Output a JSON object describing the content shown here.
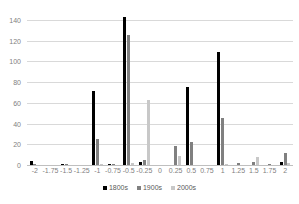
{
  "chart_data": {
    "type": "bar",
    "title": "",
    "subtitle": "",
    "xlabel": "",
    "ylabel": "",
    "ylim": [
      0,
      140
    ],
    "ytick_step": 20,
    "yticks": [
      "0",
      "20",
      "40",
      "60",
      "80",
      "100",
      "120",
      "140"
    ],
    "grid": true,
    "legend_position": "bottom",
    "categories": [
      "-2",
      "-1.75",
      "-1.5",
      "-1.25",
      "-1",
      "-0.75",
      "-0.5",
      "-0.25",
      "0",
      "0.25",
      "0.5",
      "0.75",
      "1",
      "1.25",
      "1.5",
      "1.75",
      "2"
    ],
    "series": [
      {
        "name": "1800s",
        "color": "#000000",
        "values": [
          4,
          0,
          1,
          0,
          71,
          1,
          143,
          3,
          0,
          0,
          75,
          0,
          109,
          0,
          0,
          0,
          3
        ]
      },
      {
        "name": "1900s",
        "color": "#808080",
        "values": [
          1,
          0,
          1,
          0,
          25,
          1,
          126,
          5,
          0,
          18,
          22,
          0,
          45,
          2,
          3,
          1,
          12
        ]
      },
      {
        "name": "2000s",
        "color": "#c8c8c8",
        "values": [
          0,
          0,
          0,
          0,
          1,
          0,
          2,
          63,
          0,
          9,
          0,
          0,
          1,
          0,
          8,
          0,
          2
        ]
      }
    ]
  },
  "legend": {
    "items": [
      {
        "label": "1800s"
      },
      {
        "label": "1900s"
      },
      {
        "label": "2000s"
      }
    ]
  }
}
